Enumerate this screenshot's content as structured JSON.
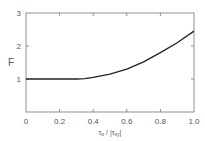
{
  "chart_data": {
    "type": "line",
    "title": "",
    "xlabel": "τ₀ / |τxy|",
    "ylabel": "F",
    "xlim": [
      0,
      1.0
    ],
    "ylim": [
      0,
      3
    ],
    "xticks": [
      "0",
      "0.2",
      "0.4",
      "0.6",
      "0.8",
      "1.0"
    ],
    "yticks": [
      "1",
      "2",
      "3"
    ],
    "grid": false,
    "legend": null,
    "series": [
      {
        "name": "F",
        "x": [
          0,
          0.1,
          0.2,
          0.3,
          0.35,
          0.4,
          0.5,
          0.6,
          0.7,
          0.8,
          0.9,
          1.0
        ],
        "y": [
          1.0,
          1.0,
          1.0,
          1.0,
          1.01,
          1.05,
          1.15,
          1.3,
          1.52,
          1.8,
          2.1,
          2.45
        ]
      }
    ]
  },
  "labels": {
    "y_axis": "F",
    "x_axis_main": "τ",
    "x_axis_sub0": "o",
    "x_axis_mid": " / |τ",
    "x_axis_sub1": "xy",
    "x_axis_end": "|"
  }
}
